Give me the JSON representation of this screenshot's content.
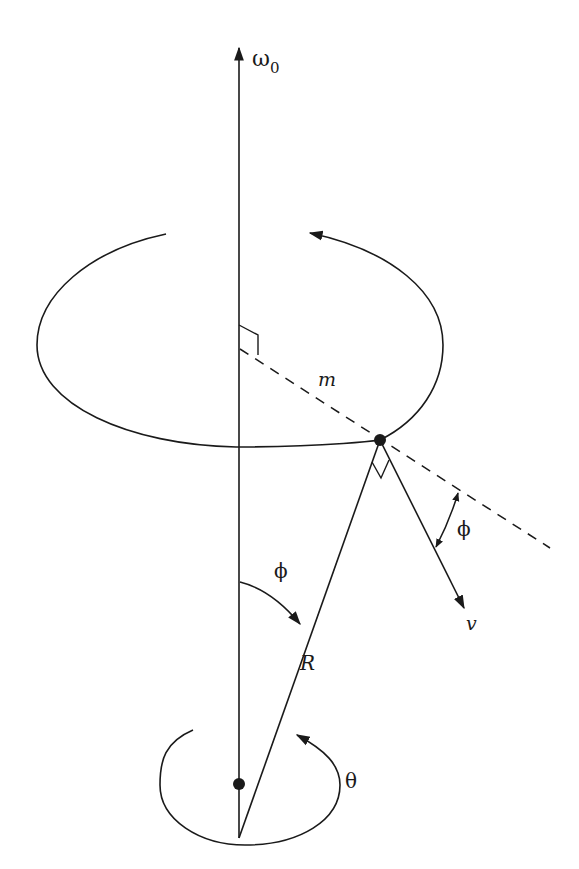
{
  "diagram": {
    "labels": {
      "omega": "ω",
      "omega_sub": "0",
      "mass": "m",
      "phi_top": "ϕ",
      "phi_side": "ϕ",
      "radius": "R",
      "velocity": "v",
      "theta": "θ"
    },
    "colors": {
      "stroke": "#1a1a1a",
      "background": "#ffffff"
    }
  }
}
